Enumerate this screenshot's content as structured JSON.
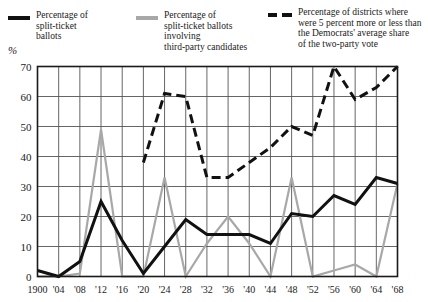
{
  "legend": {
    "entries": [
      {
        "key": "split-ticket-ballots",
        "style": "solid-black",
        "label": "Percentage of\nsplit-ticket\nballots",
        "color": "#111111"
      },
      {
        "key": "third-party-split-ticket",
        "style": "solid-gray",
        "label": "Percentage of\nsplit-ticket ballots\ninvolving\nthird-party candidates",
        "color": "#a8a8a8"
      },
      {
        "key": "districts-5-percent",
        "style": "dashed-black",
        "label": "Percentage of districts where\nwere 5 percent more or less than\nthe Democrats' average share\nof the two-party vote",
        "color": "#111111"
      }
    ]
  },
  "axis": {
    "unit": "%"
  },
  "chart_data": {
    "type": "line",
    "title": "",
    "xlabel": "",
    "ylabel": "%",
    "ylim": [
      0,
      70
    ],
    "yticks": [
      0,
      10,
      20,
      30,
      40,
      50,
      60,
      70
    ],
    "ytick_labels": [
      "0",
      "10",
      "20",
      "30",
      "40",
      "50",
      "60",
      "70"
    ],
    "grid": true,
    "legend_position": "top",
    "categories": [
      "1900",
      "'04",
      "'08",
      "'12",
      "'16",
      "'20",
      "'24",
      "'28",
      "'32",
      "'36",
      "'40",
      "'44",
      "'48",
      "'52",
      "'56",
      "'60",
      "'64",
      "'68"
    ],
    "x_values": [
      1900,
      1904,
      1908,
      1912,
      1916,
      1920,
      1924,
      1928,
      1932,
      1936,
      1940,
      1944,
      1948,
      1952,
      1956,
      1960,
      1964,
      1968
    ],
    "series": [
      {
        "name": "Percentage of split-ticket ballots",
        "style": "solid",
        "color": "#111111",
        "width": 3,
        "values": [
          2,
          0,
          5,
          25,
          12,
          1,
          10,
          19,
          14,
          14,
          14,
          11,
          21,
          20,
          27,
          24,
          33,
          31
        ]
      },
      {
        "name": "Percentage of split-ticket ballots involving third-party candidates",
        "style": "solid",
        "color": "#a8a8a8",
        "width": 2.2,
        "values": [
          0,
          0,
          1,
          49,
          0,
          0,
          33,
          0,
          11,
          20,
          11,
          0,
          33,
          0,
          2,
          4,
          0,
          31
        ]
      },
      {
        "name": "Percentage of districts where were 5 percent more or less than the Democrats' average share of the two-party vote",
        "style": "dashed",
        "color": "#111111",
        "width": 3,
        "values": [
          null,
          null,
          null,
          null,
          null,
          38,
          61,
          60,
          33,
          33,
          38,
          43,
          50,
          47,
          70,
          59,
          63,
          70
        ]
      }
    ]
  }
}
